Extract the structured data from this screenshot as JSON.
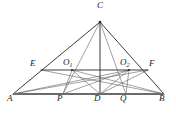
{
  "figure": {
    "type": "euclidean-geometry-diagram",
    "width": 176,
    "height": 115,
    "background_color": "#ffffff",
    "stroke_color": "#3a3a3a",
    "baseline_color": "#6b6b6b",
    "label_color": "#1a1a1a"
  },
  "points": {
    "A": {
      "label": "A",
      "x": 13,
      "y": 94,
      "label_x": 7,
      "label_y": 98
    },
    "B": {
      "label": "B",
      "x": 164,
      "y": 94,
      "label_x": 161,
      "label_y": 98
    },
    "C": {
      "label": "C",
      "x": 100,
      "y": 22,
      "label_x": 97,
      "label_y": 3
    },
    "D": {
      "label": "D",
      "x": 100,
      "y": 94,
      "label_x": 95,
      "label_y": 98
    },
    "P": {
      "label": "P",
      "x": 63,
      "y": 94,
      "label_x": 58,
      "label_y": 98
    },
    "Q": {
      "label": "Q",
      "x": 126,
      "y": 94,
      "label_x": 121,
      "label_y": 98
    },
    "E": {
      "label": "E",
      "x": 41,
      "y": 70,
      "label_x": 31,
      "label_y": 63
    },
    "F": {
      "label": "F",
      "x": 148,
      "y": 70,
      "label_x": 150,
      "label_y": 63
    },
    "O1": {
      "label": "O",
      "sub": "1",
      "x": 72,
      "y": 70,
      "label_x": 63,
      "label_y": 62
    },
    "O2": {
      "label": "O",
      "sub": "2",
      "x": 129,
      "y": 70,
      "label_x": 120,
      "label_y": 62
    }
  },
  "segments": [
    {
      "name": "side-AC",
      "from": "A",
      "to": "C",
      "style": "solid",
      "weight": "medium"
    },
    {
      "name": "side-CB",
      "from": "C",
      "to": "B",
      "style": "solid",
      "weight": "medium"
    },
    {
      "name": "base-AB",
      "from": "A",
      "to": "B",
      "style": "solid",
      "weight": "heavy"
    },
    {
      "name": "altitude-CD",
      "from": "C",
      "to": "D",
      "style": "solid",
      "weight": "medium"
    },
    {
      "name": "midline-EF",
      "from": "E",
      "to": "F",
      "style": "solid",
      "weight": "medium"
    },
    {
      "name": "cevian-CP",
      "from": "C",
      "to": "P",
      "style": "dashed",
      "weight": "light"
    },
    {
      "name": "cevian-CQ",
      "from": "C",
      "to": "Q",
      "style": "dashed",
      "weight": "light"
    },
    {
      "name": "ray-A-O2",
      "from": "A",
      "to": "O2",
      "style": "dashed",
      "weight": "light"
    },
    {
      "name": "ray-A-O2-extended",
      "from": "A",
      "to": "F",
      "style": "dashed",
      "weight": "light"
    },
    {
      "name": "ray-B-O1",
      "from": "B",
      "to": "O1",
      "style": "dashed",
      "weight": "light"
    },
    {
      "name": "ray-B-O1-extended",
      "from": "B",
      "to": "E",
      "style": "dashed",
      "weight": "light"
    },
    {
      "name": "segment-A-Q",
      "from": "A",
      "to": "Q",
      "style": "dashed",
      "weight": "light"
    },
    {
      "name": "segment-B-P",
      "from": "B",
      "to": "P",
      "style": "dashed",
      "weight": "light"
    },
    {
      "name": "segment-O1-P",
      "from": "O1",
      "to": "P",
      "style": "dashed",
      "weight": "light"
    },
    {
      "name": "segment-O1-D",
      "from": "O1",
      "to": "D",
      "style": "dashed",
      "weight": "light"
    },
    {
      "name": "segment-O2-D",
      "from": "O2",
      "to": "D",
      "style": "dashed",
      "weight": "light"
    },
    {
      "name": "segment-O2-Q",
      "from": "O2",
      "to": "Q",
      "style": "dashed",
      "weight": "light"
    }
  ]
}
